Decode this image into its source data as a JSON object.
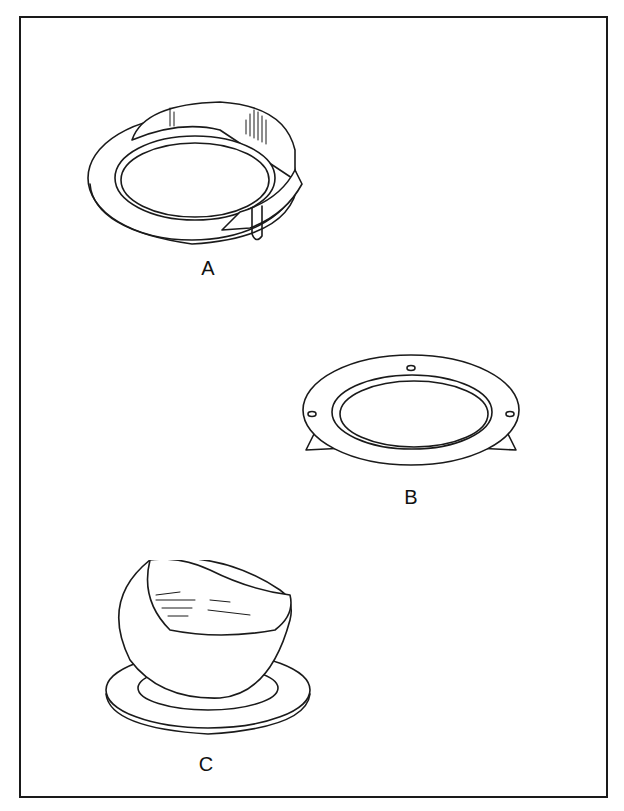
{
  "figure": {
    "title": "",
    "border_color": "#1a1a1a",
    "background": "#ffffff",
    "panels": [
      {
        "id": "A",
        "label": "A",
        "description": "Flanged ring with a wrapped band/strap ends overlapping and a clip loop"
      },
      {
        "id": "B",
        "label": "B",
        "description": "Flat flange ring with three mounting holes and two tabs underneath"
      },
      {
        "id": "C",
        "label": "C",
        "description": "Spherical scoop-shaped cup seated on a flat round base plate"
      }
    ]
  }
}
